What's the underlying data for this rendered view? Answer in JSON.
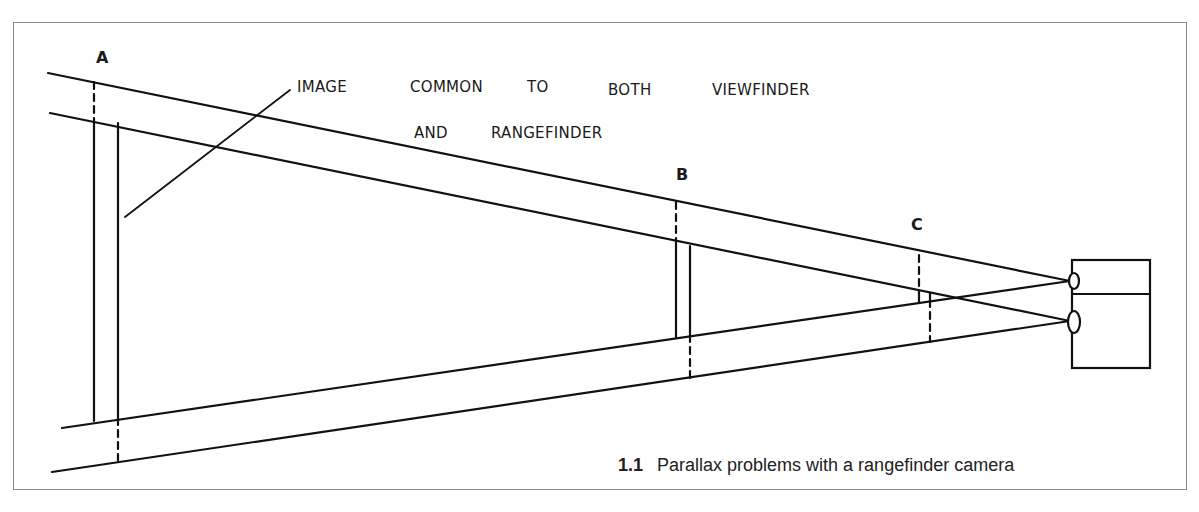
{
  "figure": {
    "number": "1.1",
    "caption": "Parallax problems with a rangefinder camera"
  },
  "labels": {
    "a": "A",
    "b": "B",
    "c": "C"
  },
  "annotation": {
    "line1_words": [
      "IMAGE",
      "COMMON",
      "TO",
      "BOTH",
      "VIEWFINDER"
    ],
    "line2_words": [
      "AND",
      "RANGEFINDER"
    ]
  },
  "colors": {
    "ink": "#111111",
    "frame": "#8a8a8a",
    "background": "#ffffff"
  }
}
